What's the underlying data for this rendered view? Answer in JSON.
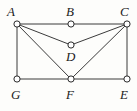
{
  "figure": {
    "kind": "undirected-graph-diagram",
    "width": 137,
    "height": 111,
    "background_color": "#fdfdfb",
    "edge_color": "#3b3b3b",
    "vertex_stroke_color": "#2b2b2b",
    "vertex_fill_color": "#ffffff",
    "label_color": "#1b1b1b",
    "vertex_radius": 3.1,
    "edge_width": 1.0
  },
  "vertices": [
    {
      "id": "A",
      "label": "A",
      "cx": 17,
      "cy": 24,
      "label_x": 7,
      "label_y": 5,
      "label_anchor": "above-left"
    },
    {
      "id": "B",
      "label": "B",
      "cx": 71,
      "cy": 24,
      "label_x": 66,
      "label_y": 5,
      "label_anchor": "above"
    },
    {
      "id": "C",
      "label": "C",
      "cx": 127,
      "cy": 24,
      "label_x": 120,
      "label_y": 5,
      "label_anchor": "above-right"
    },
    {
      "id": "D",
      "label": "D",
      "cx": 71,
      "cy": 45,
      "label_x": 66,
      "label_y": 50,
      "label_anchor": "below"
    },
    {
      "id": "G",
      "label": "G",
      "cx": 17,
      "cy": 79,
      "label_x": 11,
      "label_y": 88,
      "label_anchor": "below"
    },
    {
      "id": "F",
      "label": "F",
      "cx": 71,
      "cy": 79,
      "label_x": 66,
      "label_y": 88,
      "label_anchor": "below"
    },
    {
      "id": "E",
      "label": "E",
      "cx": 127,
      "cy": 79,
      "label_x": 120,
      "label_y": 88,
      "label_anchor": "below"
    }
  ],
  "edges": [
    {
      "from": "A",
      "to": "B"
    },
    {
      "from": "B",
      "to": "C"
    },
    {
      "from": "A",
      "to": "G"
    },
    {
      "from": "C",
      "to": "E"
    },
    {
      "from": "G",
      "to": "F"
    },
    {
      "from": "F",
      "to": "E"
    },
    {
      "from": "A",
      "to": "D"
    },
    {
      "from": "A",
      "to": "F"
    },
    {
      "from": "C",
      "to": "D"
    },
    {
      "from": "C",
      "to": "F"
    }
  ]
}
